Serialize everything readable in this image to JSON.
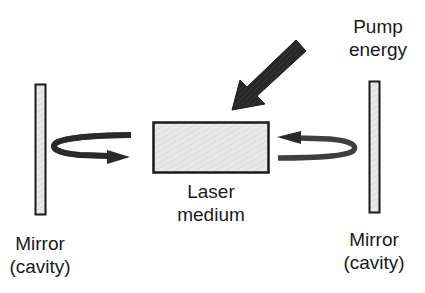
{
  "diagram": {
    "labels": {
      "pump": {
        "line1": "Pump",
        "line2": "energy"
      },
      "medium": {
        "line1": "Laser",
        "line2": "medium"
      },
      "mirror_left": {
        "line1": "Mirror",
        "line2": "(cavity)"
      },
      "mirror_right": {
        "line1": "Mirror",
        "line2": "(cavity)"
      }
    },
    "icons": {
      "pump_arrow": "pump-energy-arrow-icon",
      "feedback_left": "curved-arrow-right-icon",
      "feedback_right": "curved-arrow-left-icon"
    },
    "colors": {
      "outline": "#1a1a1a",
      "fill_light": "#e6e6e6",
      "arrow_fill": "#2a2a2a",
      "background": "#ffffff"
    }
  }
}
